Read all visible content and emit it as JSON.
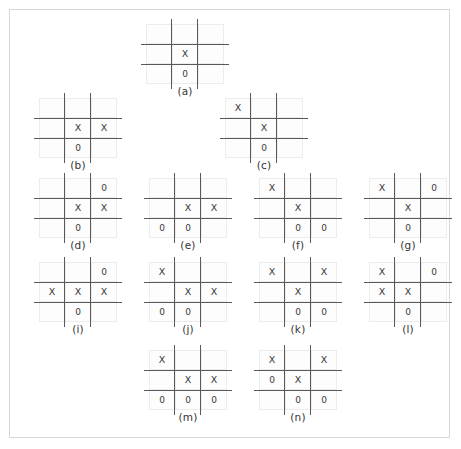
{
  "figure": {
    "type": "tic-tac-toe-game-tree",
    "mark_x": "X",
    "mark_o": "0",
    "empty": "",
    "line_color": "#595959",
    "cell_border_color": "#ececec",
    "frame_border_color": "#d8d8d8",
    "text_color": "#333333",
    "rows": [
      {
        "row_name": "row-1",
        "boards": [
          {
            "label": "(a)",
            "cells": [
              "",
              "",
              "",
              "",
              "X",
              "",
              "",
              "0",
              ""
            ]
          }
        ]
      },
      {
        "row_name": "row-2",
        "boards": [
          {
            "label": "(b)",
            "cells": [
              "",
              "",
              "",
              "",
              "X",
              "X",
              "",
              "0",
              ""
            ]
          },
          {
            "label": "(c)",
            "cells": [
              "X",
              "",
              "",
              "",
              "X",
              "",
              "",
              "0",
              ""
            ]
          }
        ]
      },
      {
        "row_name": "row-3",
        "boards": [
          {
            "label": "(d)",
            "cells": [
              "",
              "",
              "0",
              "",
              "X",
              "X",
              "",
              "0",
              ""
            ]
          },
          {
            "label": "(e)",
            "cells": [
              "",
              "",
              "",
              "",
              "X",
              "X",
              "0",
              "0",
              ""
            ]
          },
          {
            "label": "(f)",
            "cells": [
              "X",
              "",
              "",
              "",
              "X",
              "",
              "",
              "0",
              "0"
            ]
          },
          {
            "label": "(g)",
            "cells": [
              "X",
              "",
              "0",
              "",
              "X",
              "",
              "",
              "0",
              ""
            ]
          }
        ]
      },
      {
        "row_name": "row-4",
        "boards": [
          {
            "label": "(i)",
            "cells": [
              "",
              "",
              "0",
              "X",
              "X",
              "X",
              "",
              "0",
              ""
            ]
          },
          {
            "label": "(j)",
            "cells": [
              "X",
              "",
              "",
              "",
              "X",
              "X",
              "0",
              "0",
              ""
            ]
          },
          {
            "label": "(k)",
            "cells": [
              "X",
              "",
              "X",
              "",
              "X",
              "",
              "",
              "0",
              "0"
            ]
          },
          {
            "label": "(l)",
            "cells": [
              "X",
              "",
              "0",
              "X",
              "X",
              "",
              "",
              "0",
              ""
            ]
          }
        ]
      },
      {
        "row_name": "row-5",
        "boards": [
          {
            "label": "(m)",
            "cells": [
              "X",
              "",
              "",
              "",
              "X",
              "X",
              "0",
              "0",
              "0"
            ]
          },
          {
            "label": "(n)",
            "cells": [
              "X",
              "",
              "X",
              "0",
              "X",
              "",
              "",
              "0",
              "0"
            ]
          }
        ]
      }
    ]
  }
}
